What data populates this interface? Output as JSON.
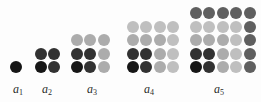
{
  "figure": {
    "kind": "square-number-dot-diagram",
    "ring_colors": {
      "ring1": "#161616",
      "ring2": "#323232",
      "ring3": "#acacac",
      "ring4": "#bfbfbf",
      "ring5": "#5f5f5f"
    },
    "background": "#fdfdfd",
    "groups": [
      {
        "id": "a1",
        "label_base": "a",
        "label_sub": "1",
        "n": 1,
        "dot_count": 1,
        "rows": [
          [
            1
          ]
        ]
      },
      {
        "id": "a2",
        "label_base": "a",
        "label_sub": "2",
        "n": 2,
        "dot_count": 4,
        "rows": [
          [
            2,
            2
          ],
          [
            1,
            2
          ]
        ]
      },
      {
        "id": "a3",
        "label_base": "a",
        "label_sub": "3",
        "n": 3,
        "dot_count": 9,
        "rows": [
          [
            3,
            3,
            3
          ],
          [
            2,
            2,
            3
          ],
          [
            1,
            2,
            3
          ]
        ]
      },
      {
        "id": "a4",
        "label_base": "a",
        "label_sub": "4",
        "n": 4,
        "dot_count": 16,
        "rows": [
          [
            4,
            4,
            4,
            4
          ],
          [
            3,
            3,
            3,
            4
          ],
          [
            2,
            2,
            3,
            4
          ],
          [
            1,
            2,
            3,
            4
          ]
        ]
      },
      {
        "id": "a5",
        "label_base": "a",
        "label_sub": "5",
        "n": 5,
        "dot_count": 25,
        "rows": [
          [
            5,
            5,
            5,
            5,
            5
          ],
          [
            4,
            4,
            4,
            4,
            5
          ],
          [
            3,
            3,
            3,
            4,
            5
          ],
          [
            2,
            2,
            3,
            4,
            5
          ],
          [
            1,
            2,
            3,
            4,
            5
          ]
        ]
      }
    ]
  }
}
